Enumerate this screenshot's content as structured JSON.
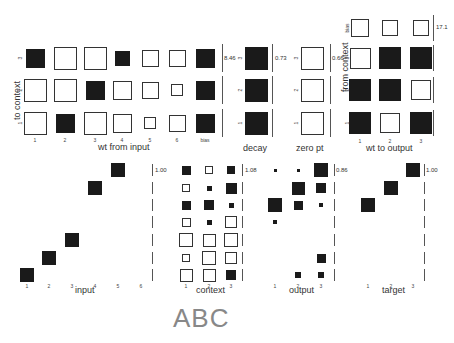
{
  "figure_label": "ABC",
  "panels": {
    "wt_from_input": {
      "title": "wt from input",
      "ylabel": "to context",
      "col_labels": [
        "1",
        "2",
        "3",
        "4",
        "5",
        "6",
        "bias"
      ],
      "row_labels": [
        "3",
        "2",
        "1"
      ],
      "scale": "8.46",
      "values": [
        [
          0.55,
          -0.75,
          -0.8,
          0.35,
          -0.45,
          -0.45,
          0.55
        ],
        [
          -0.75,
          -0.8,
          0.55,
          -0.55,
          -0.45,
          -0.2,
          0.55
        ],
        [
          -0.75,
          0.55,
          -0.8,
          -0.55,
          -0.2,
          -0.45,
          0.55
        ]
      ]
    },
    "decay": {
      "title": "decay",
      "row_labels": [
        "3",
        "2",
        "1"
      ],
      "scale": "0.73",
      "values": [
        [
          0.9
        ],
        [
          0.9
        ],
        [
          0.9
        ]
      ]
    },
    "zero_pt": {
      "title": "zero pt",
      "row_labels": [
        "3",
        "2",
        "1"
      ],
      "scale": "0.66",
      "values": [
        [
          -0.9
        ],
        [
          -0.9
        ],
        [
          -0.9
        ]
      ]
    },
    "wt_to_output": {
      "title": "wt to output",
      "ylabel": "from context",
      "col_labels": [
        "1",
        "2",
        "3"
      ],
      "row_labels": [
        "bias",
        "3",
        "2",
        "1"
      ],
      "scale": "17.1",
      "values": [
        [
          -0.55,
          -0.45,
          -0.45
        ],
        [
          -0.75,
          0.85,
          0.85
        ],
        [
          0.85,
          0.85,
          -0.7
        ],
        [
          0.85,
          -0.7,
          0.85
        ]
      ]
    },
    "input": {
      "title": "input",
      "col_labels": [
        "1",
        "2",
        "3",
        "4",
        "5",
        "6"
      ],
      "scale": "1.00",
      "values": [
        [
          0,
          0,
          0,
          0,
          1,
          0
        ],
        [
          0,
          0,
          0,
          1,
          0,
          0
        ],
        [
          0,
          0,
          0,
          0,
          0,
          0
        ],
        [
          0,
          0,
          0,
          0,
          0,
          0
        ],
        [
          0,
          0,
          1,
          0,
          0,
          0
        ],
        [
          0,
          1,
          0,
          0,
          0,
          0
        ],
        [
          1,
          0,
          0,
          0,
          0,
          0
        ]
      ]
    },
    "context": {
      "title": "context",
      "col_labels": [
        "1",
        "2",
        "3"
      ],
      "scale": "1.08",
      "values": [
        [
          0.45,
          -0.3,
          0.35
        ],
        [
          -0.3,
          0.12,
          0.6
        ],
        [
          0.45,
          0.55,
          0.12
        ],
        [
          -0.4,
          0.12,
          -0.75
        ],
        [
          -0.95,
          -0.8,
          -1.0
        ],
        [
          -0.3,
          -1.0,
          -0.75
        ],
        [
          -0.9,
          -0.9,
          0.55
        ]
      ]
    },
    "output": {
      "title": "output",
      "col_labels": [
        "1",
        "2",
        "3"
      ],
      "scale": "0.86",
      "values": [
        [
          0.05,
          0.05,
          1.0
        ],
        [
          0,
          0.9,
          0.5
        ],
        [
          0.95,
          0.45,
          0.08
        ],
        [
          0.08,
          0,
          0
        ],
        [
          0,
          0,
          0
        ],
        [
          0,
          0,
          0.4
        ],
        [
          0,
          0.2,
          0.2
        ]
      ]
    },
    "target": {
      "title": "target",
      "col_labels": [
        "1",
        "2",
        "3"
      ],
      "scale": "1.00",
      "values": [
        [
          0,
          0,
          1
        ],
        [
          0,
          1,
          0
        ],
        [
          1,
          0,
          0
        ],
        [
          0,
          0,
          0
        ],
        [
          0,
          0,
          0
        ],
        [
          0,
          0,
          0
        ],
        [
          0,
          0,
          0
        ]
      ]
    }
  },
  "colors": {
    "positive": "#1a1a1a",
    "negative_outline": "#333333",
    "background": "#ffffff"
  }
}
